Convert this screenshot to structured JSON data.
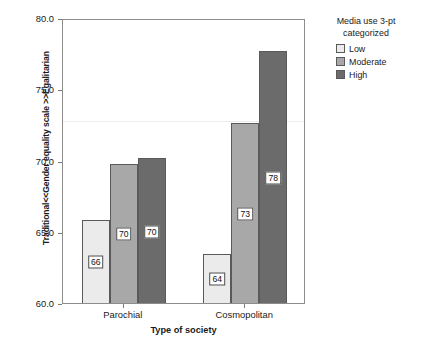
{
  "chart_data": {
    "type": "bar",
    "title": "",
    "xlabel": "Type of society",
    "ylabel": "Traditional<<Gender equality scale >>Egalitarian",
    "categories": [
      "Parochial",
      "Cosmopolitan"
    ],
    "series": [
      {
        "name": "Low",
        "values": [
          66.0,
          63.6
        ],
        "labels": [
          "66",
          "64"
        ],
        "color": "#ebebeb"
      },
      {
        "name": "Moderate",
        "values": [
          69.9,
          72.8
        ],
        "labels": [
          "70",
          "73"
        ],
        "color": "#a8a8a8"
      },
      {
        "name": "High",
        "values": [
          70.3,
          77.8
        ],
        "labels": [
          "70",
          "78"
        ],
        "color": "#6b6b6b"
      }
    ],
    "ylim": [
      60.0,
      80.0
    ],
    "yticks": [
      "60.0",
      "65.0",
      "70.0",
      "75.0",
      "80.0"
    ],
    "ytick_values": [
      60.0,
      65.0,
      70.0,
      75.0,
      80.0
    ],
    "grid": false,
    "reference_line": 72.9,
    "legend_position": "right"
  },
  "legend": {
    "title_line1": "Media use 3-pt",
    "title_line2": "categorized",
    "entries": [
      {
        "label": "Low",
        "color": "#ebebeb"
      },
      {
        "label": "Moderate",
        "color": "#a8a8a8"
      },
      {
        "label": "High",
        "color": "#6b6b6b"
      }
    ]
  }
}
